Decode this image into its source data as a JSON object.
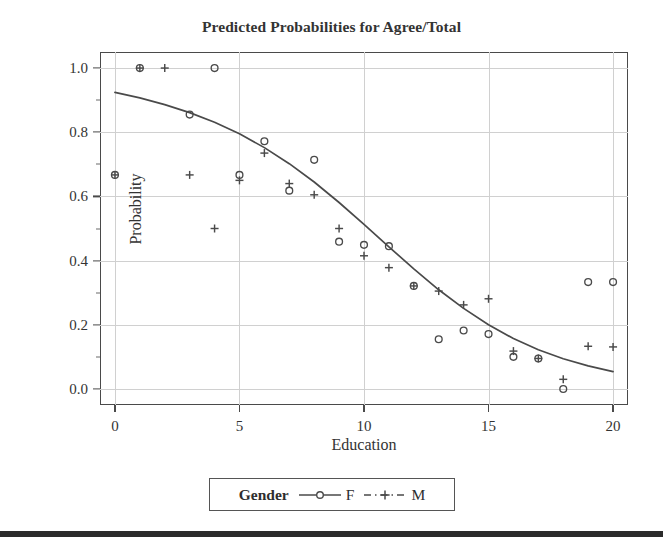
{
  "chart_data": {
    "type": "scatter",
    "title": "Predicted Probabilities for Agree/Total",
    "xlabel": "Education",
    "ylabel": "Probability",
    "xlim": [
      -0.6,
      20.6
    ],
    "ylim": [
      -0.05,
      1.05
    ],
    "xticks": [
      0,
      5,
      10,
      15,
      20
    ],
    "xtick_labels": [
      "0",
      "5",
      "10",
      "15",
      "20"
    ],
    "yticks": [
      0.0,
      0.2,
      0.4,
      0.6,
      0.8,
      1.0
    ],
    "ytick_labels": [
      "0.0",
      "0.2",
      "0.4",
      "0.6",
      "0.8",
      "1.0"
    ],
    "grid": true,
    "legend": {
      "title": "Gender",
      "position": "bottom-outside",
      "entries": [
        {
          "label": "F",
          "marker": "circle",
          "line": "solid",
          "color": "#4a4a4a"
        },
        {
          "label": "M",
          "marker": "plus",
          "line": "dashed",
          "color": "#4a4a4a"
        }
      ]
    },
    "series": [
      {
        "name": "F",
        "marker": "circle",
        "color": "#4a4a4a",
        "points": [
          {
            "x": 0,
            "y": 0.667
          },
          {
            "x": 1,
            "y": 1.0
          },
          {
            "x": 3,
            "y": 0.855
          },
          {
            "x": 4,
            "y": 1.0
          },
          {
            "x": 5,
            "y": 0.667
          },
          {
            "x": 6,
            "y": 0.772
          },
          {
            "x": 7,
            "y": 0.618
          },
          {
            "x": 8,
            "y": 0.714
          },
          {
            "x": 9,
            "y": 0.459
          },
          {
            "x": 10,
            "y": 0.449
          },
          {
            "x": 11,
            "y": 0.445
          },
          {
            "x": 12,
            "y": 0.321
          },
          {
            "x": 13,
            "y": 0.155
          },
          {
            "x": 14,
            "y": 0.182
          },
          {
            "x": 15,
            "y": 0.171
          },
          {
            "x": 16,
            "y": 0.1
          },
          {
            "x": 17,
            "y": 0.095
          },
          {
            "x": 18,
            "y": 0.0
          },
          {
            "x": 19,
            "y": 0.333
          },
          {
            "x": 20,
            "y": 0.333
          }
        ]
      },
      {
        "name": "M",
        "marker": "plus",
        "color": "#4a4a4a",
        "points": [
          {
            "x": 0,
            "y": 0.667
          },
          {
            "x": 1,
            "y": 1.0
          },
          {
            "x": 2,
            "y": 1.0
          },
          {
            "x": 3,
            "y": 0.667
          },
          {
            "x": 4,
            "y": 0.5
          },
          {
            "x": 5,
            "y": 0.65
          },
          {
            "x": 6,
            "y": 0.735
          },
          {
            "x": 7,
            "y": 0.64
          },
          {
            "x": 8,
            "y": 0.605
          },
          {
            "x": 9,
            "y": 0.5
          },
          {
            "x": 10,
            "y": 0.415
          },
          {
            "x": 11,
            "y": 0.378
          },
          {
            "x": 12,
            "y": 0.321
          },
          {
            "x": 13,
            "y": 0.305
          },
          {
            "x": 14,
            "y": 0.262
          },
          {
            "x": 15,
            "y": 0.281
          },
          {
            "x": 16,
            "y": 0.118
          },
          {
            "x": 17,
            "y": 0.095
          },
          {
            "x": 18,
            "y": 0.03
          },
          {
            "x": 19,
            "y": 0.133
          },
          {
            "x": 20,
            "y": 0.131
          }
        ]
      }
    ],
    "fitted_curve": {
      "name": "Predicted probability (logistic fit)",
      "style": "solid",
      "color": "#4a4a4a",
      "points": [
        {
          "x": 0,
          "y": 0.924
        },
        {
          "x": 1,
          "y": 0.907
        },
        {
          "x": 2,
          "y": 0.886
        },
        {
          "x": 3,
          "y": 0.861
        },
        {
          "x": 4,
          "y": 0.831
        },
        {
          "x": 5,
          "y": 0.795
        },
        {
          "x": 6,
          "y": 0.752
        },
        {
          "x": 7,
          "y": 0.702
        },
        {
          "x": 8,
          "y": 0.645
        },
        {
          "x": 9,
          "y": 0.581
        },
        {
          "x": 10,
          "y": 0.513
        },
        {
          "x": 11,
          "y": 0.443
        },
        {
          "x": 12,
          "y": 0.374
        },
        {
          "x": 13,
          "y": 0.309
        },
        {
          "x": 14,
          "y": 0.251
        },
        {
          "x": 15,
          "y": 0.2
        },
        {
          "x": 16,
          "y": 0.157
        },
        {
          "x": 17,
          "y": 0.122
        },
        {
          "x": 18,
          "y": 0.094
        },
        {
          "x": 19,
          "y": 0.072
        },
        {
          "x": 20,
          "y": 0.054
        }
      ]
    }
  }
}
